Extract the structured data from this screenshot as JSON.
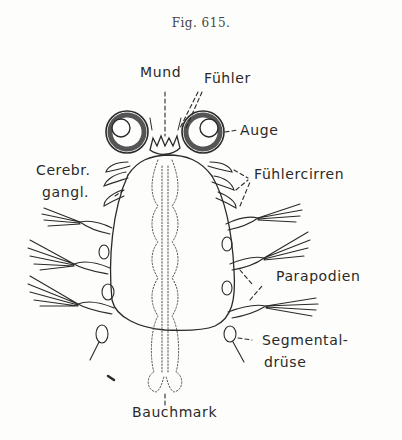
{
  "figure": {
    "title": "Fig. 615."
  },
  "labels": {
    "mund": "Mund",
    "fuehler": "Fühler",
    "auge": "Auge",
    "cerebr_1": "Cerebr.",
    "cerebr_2": "gangl.",
    "fuehlercirren": "Fühlercirren",
    "parapodien": "Parapodien",
    "segmental_1": "Segmental-",
    "segmental_2": "drüse",
    "bauchmark": "Bauchmark"
  },
  "colors": {
    "ink": "#2a2a2a",
    "paper": "#fdfdfb"
  }
}
